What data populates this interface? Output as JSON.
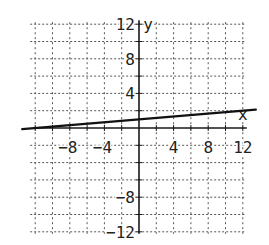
{
  "chart_data": {
    "type": "line",
    "title": "",
    "xlabel": "x",
    "ylabel": "y",
    "xlim": [
      -12,
      12
    ],
    "ylim": [
      -12,
      12
    ],
    "grid": true,
    "grid_style": "dotted",
    "grid_step": 2,
    "x_ticks": [
      -8,
      -4,
      4,
      8,
      12
    ],
    "y_ticks": [
      12,
      8,
      4,
      -8,
      -12
    ],
    "x_tick_labels": [
      "−8",
      "−4",
      "4",
      "8",
      "12"
    ],
    "y_tick_labels": [
      "12",
      "8",
      "4",
      "−8",
      "−12"
    ],
    "series": [
      {
        "name": "line",
        "equation": "y = x/12 + 1",
        "x": [
          -13.5,
          13.5
        ],
        "y": [
          -0.125,
          2.125
        ]
      }
    ]
  },
  "colors": {
    "background": "#ffffff",
    "axis": "#1a1a1a",
    "grid": "#555555",
    "line": "#111111"
  }
}
